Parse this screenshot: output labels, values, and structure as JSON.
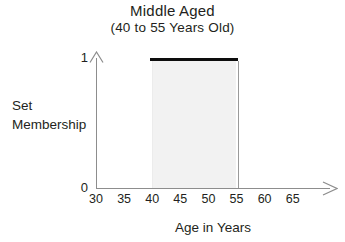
{
  "chart_data": {
    "type": "area",
    "title": "Middle Aged",
    "subtitle": "(40 to 55 Years Old)",
    "xlabel": "Age in Years",
    "ylabel_lines": [
      "Set",
      "Membership"
    ],
    "xlim": [
      30,
      65
    ],
    "ylim": [
      0,
      1
    ],
    "xticks": [
      30,
      35,
      40,
      45,
      50,
      55,
      60,
      65
    ],
    "xtick_labels": [
      "30",
      "35",
      "40",
      "45",
      "50",
      "55",
      "60",
      "65"
    ],
    "yticks": [
      0,
      1
    ],
    "ytick_labels": [
      "0",
      "1"
    ],
    "grid": false,
    "legend": "none",
    "series": [
      {
        "name": "Middle Aged",
        "kind": "crisp-set-membership",
        "x": [
          30,
          40,
          40,
          55,
          55,
          65
        ],
        "values": [
          0,
          0,
          1,
          1,
          0,
          0
        ],
        "support_start": 40,
        "support_end": 55,
        "plateau_value": 1,
        "fill_color": "#f2f2f2",
        "line_color": "#0d0d0d"
      }
    ],
    "annotations": []
  },
  "figure": {
    "background": "#ffffff",
    "axis_color": "#8d8d8d",
    "text_color": "#231f20"
  }
}
